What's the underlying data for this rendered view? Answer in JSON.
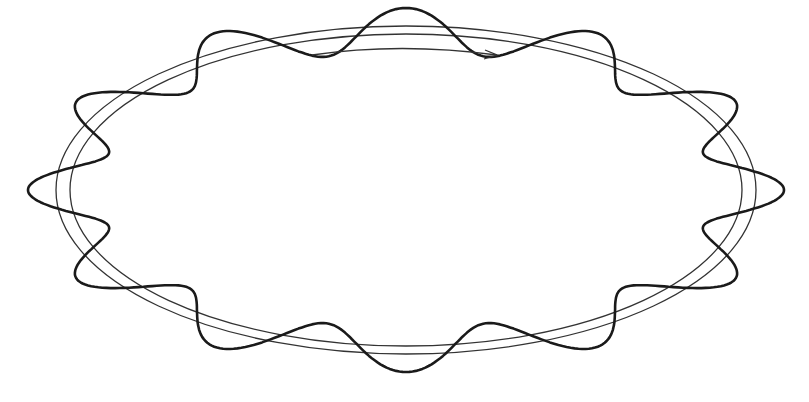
{
  "figure": {
    "colors": {
      "background": "#ffffff",
      "ring_stroke": "#333333",
      "wave_stroke": "#1a1a1a",
      "arrow_stroke": "#333333"
    },
    "ring": {
      "center": [
        406,
        190
      ],
      "outer": {
        "rx": 350,
        "ry": 164
      },
      "inner": {
        "rx": 336,
        "ry": 156
      }
    },
    "wave": {
      "lobes": 12,
      "base_rx": 343,
      "base_ry": 160,
      "amplitude_x": 35,
      "amplitude_y": 22
    },
    "arrow": {
      "direction": "clockwise",
      "start": [
        312,
        55
      ],
      "control": [
        400,
        42
      ],
      "end": [
        497,
        55
      ]
    }
  }
}
